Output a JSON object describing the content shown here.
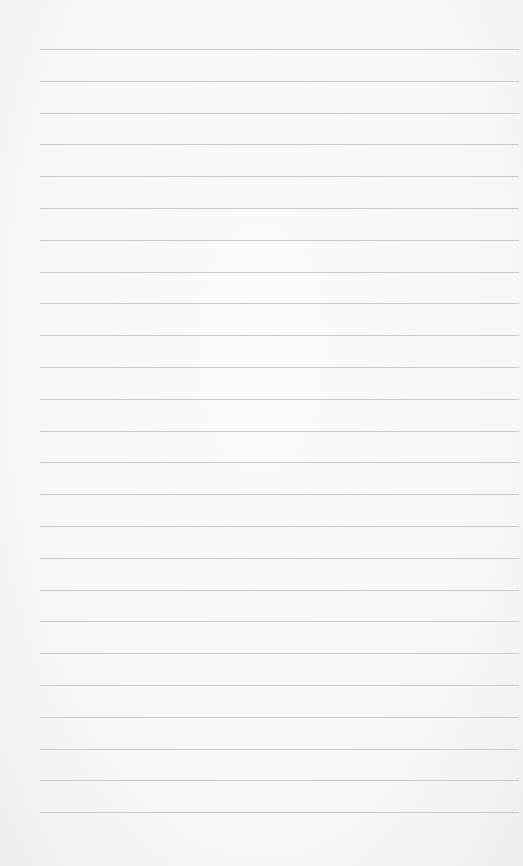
{
  "paper": {
    "type": "blank lined paper",
    "line_count": 25,
    "first_line_y": 49,
    "line_spacing": 31.8,
    "line_left": 40,
    "line_color": "#c9c9c7",
    "background_color": "#f7f7f6"
  }
}
